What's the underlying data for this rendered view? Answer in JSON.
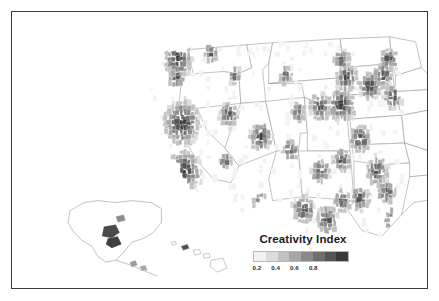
{
  "figure": {
    "kind": "choropleth-map",
    "region": "United States (counties, with Alaska and Hawaii insets)",
    "background_color": "#ffffff",
    "frame_color": "#3a3a3a"
  },
  "legend": {
    "title": "Creativity Index",
    "orientation": "horizontal",
    "ticks": [
      "0.2",
      "0.4",
      "0.6",
      "0.8"
    ],
    "tick_values": [
      0.2,
      0.4,
      0.6,
      0.8
    ],
    "colors": [
      "#f2f2f2",
      "#dcdcdc",
      "#c2c2c2",
      "#a6a6a6",
      "#8a8a8a",
      "#6e6e6e",
      "#545454",
      "#3a3a3a"
    ]
  },
  "chart_data": {
    "type": "heatmap",
    "title": "Creativity Index",
    "xlabel": "",
    "ylabel": "",
    "colorbar_label": "Creativity Index",
    "colorbar_ticks": [
      0.2,
      0.4,
      0.6,
      0.8
    ],
    "value_range": [
      0.0,
      1.0
    ],
    "colormap": "grayscale-sequential",
    "geography": "US counties",
    "insets": [
      "Alaska",
      "Hawaii"
    ],
    "regions": [
      {
        "name": "Northeast corridor (Boston-NY-Philadelphia-DC)",
        "value": 0.88
      },
      {
        "name": "San Francisco Bay Area",
        "value": 0.85
      },
      {
        "name": "Los Angeles / San Diego metro",
        "value": 0.8
      },
      {
        "name": "Seattle / Puget Sound",
        "value": 0.82
      },
      {
        "name": "Chicago metro",
        "value": 0.78
      },
      {
        "name": "Denver / Front Range",
        "value": 0.76
      },
      {
        "name": "Austin / Dallas / Houston metros",
        "value": 0.75
      },
      {
        "name": "Atlanta metro",
        "value": 0.74
      },
      {
        "name": "Florida coastal counties",
        "value": 0.7
      },
      {
        "name": "Minneapolis-St. Paul",
        "value": 0.72
      },
      {
        "name": "Great Plains rural counties",
        "value": 0.15
      },
      {
        "name": "Interior West rural counties",
        "value": 0.18
      },
      {
        "name": "Anchorage, Alaska",
        "value": 0.8
      },
      {
        "name": "Honolulu, Hawaii",
        "value": 0.65
      }
    ]
  }
}
